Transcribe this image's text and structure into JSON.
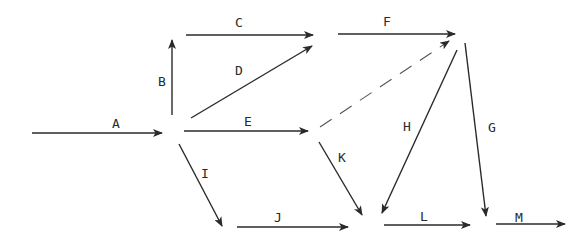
{
  "diagram": {
    "type": "activity-on-arrow network",
    "color": "#2a2a2a",
    "edges": [
      {
        "id": "A",
        "label": "A",
        "x1": 32,
        "y1": 133,
        "x2": 162,
        "y2": 133,
        "lx": 112,
        "ly": 128,
        "dashed": false
      },
      {
        "id": "B",
        "label": "B",
        "x1": 172,
        "y1": 115,
        "x2": 172,
        "y2": 40,
        "lx": 158,
        "ly": 86,
        "dashed": false
      },
      {
        "id": "C",
        "label": "C",
        "x1": 186,
        "y1": 35,
        "x2": 313,
        "y2": 35,
        "lx": 235,
        "ly": 27,
        "dashed": false
      },
      {
        "id": "D",
        "label": "D",
        "x1": 191,
        "y1": 118,
        "x2": 312,
        "y2": 46,
        "lx": 235,
        "ly": 75,
        "dashed": false
      },
      {
        "id": "E",
        "label": "E",
        "x1": 184,
        "y1": 131,
        "x2": 308,
        "y2": 131,
        "lx": 244,
        "ly": 126,
        "dashed": false
      },
      {
        "id": "F",
        "label": "F",
        "x1": 338,
        "y1": 34,
        "x2": 455,
        "y2": 34,
        "lx": 383,
        "ly": 26,
        "dashed": false
      },
      {
        "id": "dummy",
        "label": "",
        "x1": 320,
        "y1": 127,
        "x2": 449,
        "y2": 41,
        "lx": 0,
        "ly": 0,
        "dashed": true
      },
      {
        "id": "G",
        "label": "G",
        "x1": 465,
        "y1": 43,
        "x2": 486,
        "y2": 216,
        "lx": 488,
        "ly": 132,
        "dashed": false
      },
      {
        "id": "H",
        "label": "H",
        "x1": 457,
        "y1": 50,
        "x2": 382,
        "y2": 213,
        "lx": 403,
        "ly": 131,
        "dashed": false
      },
      {
        "id": "I",
        "label": "I",
        "x1": 179,
        "y1": 144,
        "x2": 222,
        "y2": 226,
        "lx": 201,
        "ly": 178,
        "dashed": false
      },
      {
        "id": "J",
        "label": "J",
        "x1": 237,
        "y1": 227,
        "x2": 348,
        "y2": 227,
        "lx": 274,
        "ly": 222,
        "dashed": false
      },
      {
        "id": "K",
        "label": "K",
        "x1": 319,
        "y1": 142,
        "x2": 362,
        "y2": 215,
        "lx": 338,
        "ly": 162,
        "dashed": false
      },
      {
        "id": "L",
        "label": "L",
        "x1": 384,
        "y1": 225,
        "x2": 470,
        "y2": 225,
        "lx": 420,
        "ly": 221,
        "dashed": false
      },
      {
        "id": "M",
        "label": "M",
        "x1": 496,
        "y1": 224,
        "x2": 565,
        "y2": 224,
        "lx": 515,
        "ly": 222,
        "dashed": false
      }
    ]
  }
}
